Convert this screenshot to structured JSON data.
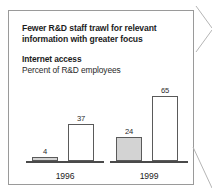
{
  "figure": {
    "headline": "Fewer R&D staff trawl for relevant information with greater focus",
    "subhead": "Internet access",
    "subnote": "Percent of R&D employees"
  },
  "chart_data": {
    "type": "bar",
    "title": "Internet access",
    "subtitle": "Percent of R&D employees",
    "xlabel": "",
    "ylabel": "Percent of R&D employees",
    "ylim": [
      0,
      70
    ],
    "grid": false,
    "legend_position": "none",
    "categories": [
      "1996",
      "1999"
    ],
    "series": [
      {
        "name": "series-a",
        "style": "filled-gray",
        "values": [
          4,
          24
        ]
      },
      {
        "name": "series-b",
        "style": "hollow-white",
        "values": [
          37,
          65
        ]
      }
    ],
    "groups": [
      {
        "category": "1996",
        "bars": [
          {
            "value": 4,
            "label": "4",
            "style": "filled-gray"
          },
          {
            "value": 37,
            "label": "37",
            "style": "hollow-white"
          }
        ]
      },
      {
        "category": "1999",
        "bars": [
          {
            "value": 24,
            "label": "24",
            "style": "filled-gray"
          },
          {
            "value": 65,
            "label": "65",
            "style": "hollow-white"
          }
        ]
      }
    ],
    "colors": {
      "filled_bar": "#d3d3d3",
      "hollow_bar": "#ffffff",
      "bar_outline": "#5a5a5a",
      "baseline": "#4a4a4a",
      "frame": "#9a9a9a",
      "text": "#1c1c1c"
    }
  }
}
